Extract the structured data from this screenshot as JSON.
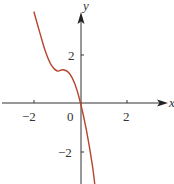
{
  "chart_data": {
    "type": "line",
    "title": "",
    "xlabel": "x",
    "ylabel": "y",
    "xlim": [
      -3.4,
      3.7
    ],
    "ylim": [
      -3.4,
      4.0
    ],
    "grid": false,
    "x_ticks": [
      {
        "value": -2,
        "label": "−2"
      },
      {
        "value": 0,
        "label": "0"
      },
      {
        "value": 2,
        "label": "2"
      }
    ],
    "y_ticks": [
      {
        "value": 2,
        "label": "2"
      },
      {
        "value": -2,
        "label": "−2"
      }
    ],
    "series": [
      {
        "name": "curve",
        "color": "#b5452b",
        "x": [
          -2.0,
          -1.75,
          -1.5,
          -1.25,
          -1.0,
          -0.75,
          -0.5,
          -0.25,
          0.0,
          0.25,
          0.5,
          0.62
        ],
        "y": [
          3.75,
          2.9,
          2.1,
          1.55,
          1.32,
          1.37,
          1.25,
          0.8,
          0.0,
          -1.1,
          -2.5,
          -3.4
        ]
      }
    ]
  },
  "labels": {
    "x_axis": "x",
    "y_axis": "y",
    "origin": "0",
    "x_tick_neg2": "−2",
    "x_tick_pos2": "2",
    "y_tick_pos2": "2",
    "y_tick_neg2": "−2"
  },
  "colors": {
    "axis": "#333333",
    "curve": "#b5452b"
  }
}
